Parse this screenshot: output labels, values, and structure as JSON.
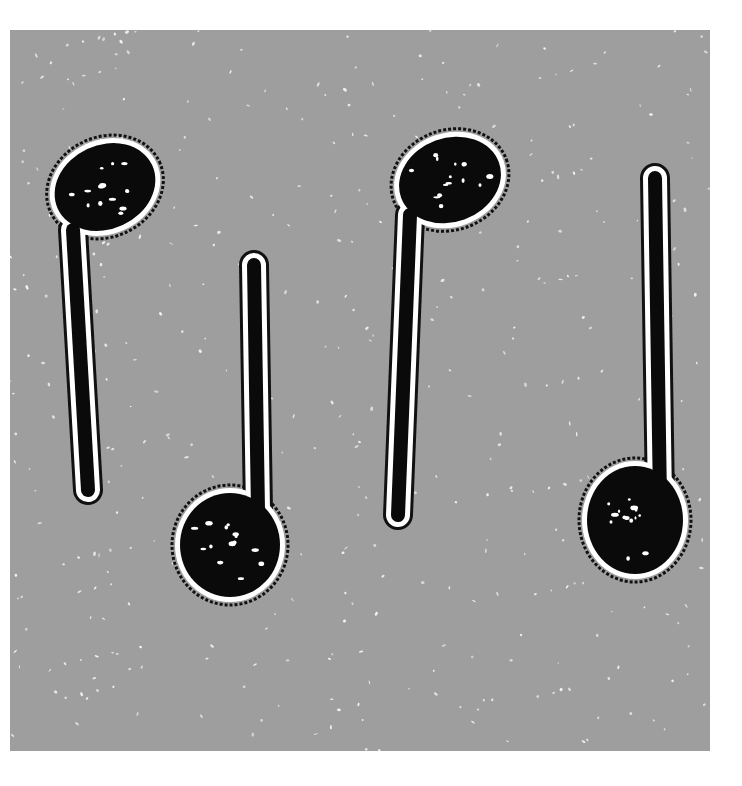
{
  "image": {
    "description": "Four hand-drawn musical note shapes (black filled note heads with stems) on a speckled grey background",
    "background_color": "#9e9e9e",
    "note_color": "#0a0a0a",
    "halo_color": "#ffffff",
    "notes": [
      {
        "name": "note-1",
        "head": {
          "cx": 95,
          "cy": 157,
          "rx": 52,
          "ry": 42,
          "rot": -25
        },
        "stem": {
          "x1": 63,
          "y1": 200,
          "x2": 78,
          "y2": 460
        }
      },
      {
        "name": "note-2",
        "head": {
          "cx": 220,
          "cy": 515,
          "rx": 50,
          "ry": 52,
          "rot": 0
        },
        "stem": {
          "x1": 244,
          "y1": 235,
          "x2": 248,
          "y2": 480
        }
      },
      {
        "name": "note-3",
        "head": {
          "cx": 440,
          "cy": 150,
          "rx": 52,
          "ry": 42,
          "rot": -20
        },
        "stem": {
          "x1": 400,
          "y1": 185,
          "x2": 388,
          "y2": 485
        }
      },
      {
        "name": "note-4",
        "head": {
          "cx": 625,
          "cy": 490,
          "rx": 48,
          "ry": 54,
          "rot": 0
        },
        "stem": {
          "x1": 645,
          "y1": 148,
          "x2": 650,
          "y2": 470
        }
      }
    ]
  }
}
